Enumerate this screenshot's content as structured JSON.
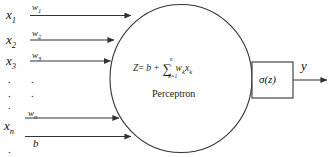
{
  "diagram": {
    "title": "Perceptron",
    "colors": {
      "stroke": "#333333",
      "background": "#ffffff",
      "text": "#1a1a1a"
    },
    "inputs": [
      {
        "name": "x",
        "subscript": "1",
        "weight_name": "w",
        "weight_subscript": "1"
      },
      {
        "name": "x",
        "subscript": "2",
        "weight_name": "w",
        "weight_subscript": "2"
      },
      {
        "name": "x",
        "subscript": "3",
        "weight_name": "w",
        "weight_subscript": "3"
      },
      {
        "name": "x",
        "subscript": "n",
        "weight_name": "w",
        "weight_subscript": "n"
      }
    ],
    "bias": {
      "label": "b"
    },
    "ellipsis_dot": ".",
    "formula": {
      "lhs": "Z",
      "equals": "=",
      "bias_term": "b",
      "plus": "+",
      "sigma": "∑",
      "sum_upper": "n",
      "sum_lower": "k=1",
      "weight": "w",
      "weight_sub": "k",
      "input": "x",
      "input_sub": "k"
    },
    "body_label": "Perceptron",
    "activation": {
      "label": "σ(z)"
    },
    "output": {
      "label": "y"
    }
  }
}
